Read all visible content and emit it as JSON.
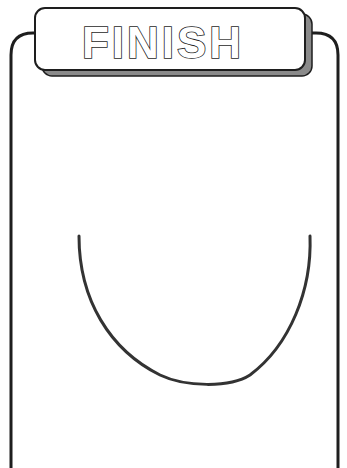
{
  "banner": {
    "title": "FINISH"
  },
  "colors": {
    "background": "#ffffff",
    "stroke": "#1e1e1e",
    "shadow": "#8a8a8a",
    "curve": "#333333"
  },
  "drawing": {
    "shape": "u-curve",
    "description": "hand-drawn U-shaped curve"
  }
}
